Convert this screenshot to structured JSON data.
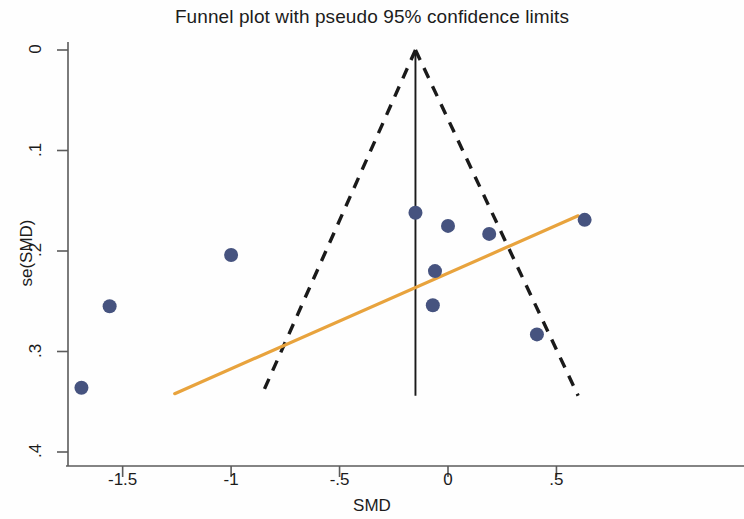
{
  "chart_data": {
    "type": "scatter",
    "title": "Funnel plot with pseudo 95% confidence limits",
    "xlabel": "SMD",
    "ylabel": "se(SMD)",
    "xlim": [
      -1.8,
      0.62
    ],
    "ylim": [
      0.42,
      -0.013
    ],
    "y_inverted": true,
    "grid": false,
    "legend": "none",
    "xticks": [
      -1.5,
      -1,
      -0.5,
      0,
      0.5
    ],
    "xtick_labels": [
      "-1.5",
      "-1",
      "-.5",
      "0",
      ".5"
    ],
    "yticks": [
      0,
      0.1,
      0.2,
      0.3,
      0.4
    ],
    "ytick_labels": [
      "0",
      ".1",
      ".2",
      ".3",
      ".4"
    ],
    "point_color": "#46537f",
    "point_radius_px": 7,
    "points": [
      {
        "x": -1.69,
        "y": 0.336
      },
      {
        "x": -1.56,
        "y": 0.255
      },
      {
        "x": -1.0,
        "y": 0.204
      },
      {
        "x": -0.15,
        "y": 0.162
      },
      {
        "x": 0.0,
        "y": 0.175
      },
      {
        "x": -0.06,
        "y": 0.22
      },
      {
        "x": -0.07,
        "y": 0.254
      },
      {
        "x": 0.19,
        "y": 0.183
      },
      {
        "x": 0.41,
        "y": 0.283
      },
      {
        "x": 0.63,
        "y": 0.169
      }
    ],
    "series": [
      {
        "name": "pseudo 95% confidence limits",
        "type": "funnel-boundary",
        "style": "dashed",
        "color": "#1a1a1a",
        "apex": {
          "x": -0.15,
          "y": 0.0
        },
        "left_end": {
          "x": -0.86,
          "y": 0.344
        },
        "right_end": {
          "x": 0.6,
          "y": 0.344
        }
      },
      {
        "name": "pooled effect estimate",
        "type": "vertical-line",
        "style": "solid",
        "color": "#1a1a1a",
        "x": -0.15,
        "y_from": 0.0,
        "y_to": 0.344
      },
      {
        "name": "Egger regression line",
        "type": "regression-line",
        "style": "solid",
        "color": "#e8a33d",
        "from": {
          "x": -1.26,
          "y": 0.342
        },
        "to": {
          "x": 0.6,
          "y": 0.165
        }
      }
    ]
  },
  "axes": {
    "title": "Funnel plot with pseudo 95% confidence limits",
    "x_axis_label": "SMD",
    "y_axis_label": "se(SMD)",
    "x_tick_labels": [
      "-1.5",
      "-1",
      "-.5",
      "0",
      ".5"
    ],
    "y_tick_labels": [
      "0",
      ".1",
      ".2",
      ".3",
      ".4"
    ]
  },
  "colors": {
    "marker": "#46537f",
    "regression": "#e8a33d",
    "funnel": "#1a1a1a",
    "axis": "#5b5b5b",
    "background": "#fefefe"
  }
}
